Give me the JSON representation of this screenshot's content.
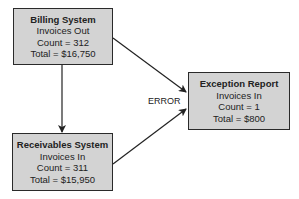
{
  "nodes": {
    "billing": {
      "title": "Billing System",
      "line1": "Invoices Out",
      "line2": "Count = 312",
      "line3": "Total = $16,750"
    },
    "receivables": {
      "title": "Receivables System",
      "line1": "Invoices In",
      "line2": "Count = 311",
      "line3": "Total = $15,950"
    },
    "exception": {
      "title": "Exception Report",
      "line1": "Invoices In",
      "line2": "Count = 1",
      "line3": "Total = $800"
    }
  },
  "edges": [
    {
      "from": "billing",
      "to": "receivables",
      "label": ""
    },
    {
      "from": "billing",
      "to": "exception",
      "label": ""
    },
    {
      "from": "receivables",
      "to": "exception",
      "label": ""
    }
  ],
  "error_label": "ERROR",
  "colors": {
    "box_fill": "#d3d3d3",
    "box_border": "#2a2a2a",
    "line": "#222222"
  }
}
